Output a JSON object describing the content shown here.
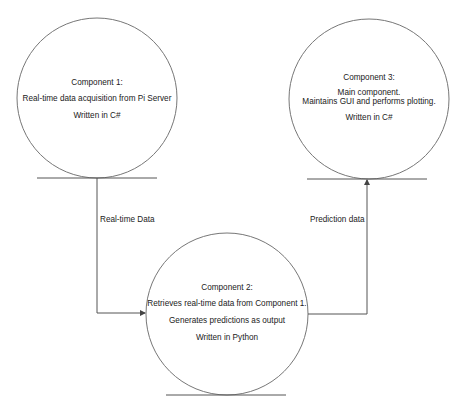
{
  "diagram": {
    "type": "data-flow",
    "colors": {
      "stroke": "#555555",
      "text": "#222222",
      "background": "#ffffff"
    },
    "nodes": [
      {
        "id": "component1",
        "title": "Component 1:",
        "lines": [
          "Real-time data acquisition from Pi Server"
        ],
        "language": "Written in C#"
      },
      {
        "id": "component2",
        "title": "Component 2:",
        "lines": [
          "Retrieves real-time data from Component 1.",
          "Generates predictions as output"
        ],
        "language": "Written in Python"
      },
      {
        "id": "component3",
        "title": "Component 3:",
        "lines": [
          "Main component.",
          "Maintains GUI and performs plotting."
        ],
        "language": "Written in C#"
      }
    ],
    "edges": [
      {
        "from": "component1",
        "to": "component2",
        "label": "Real-time Data"
      },
      {
        "from": "component2",
        "to": "component3",
        "label": "Prediction data"
      }
    ]
  }
}
